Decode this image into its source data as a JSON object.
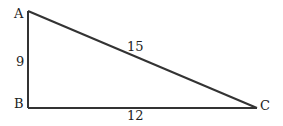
{
  "diagram": {
    "type": "right-triangle",
    "vertices": [
      {
        "id": "A",
        "label": "A",
        "x": 28,
        "y": 11,
        "label_x": 14,
        "label_y": 18
      },
      {
        "id": "B",
        "label": "B",
        "x": 28,
        "y": 108,
        "label_x": 14,
        "label_y": 108
      },
      {
        "id": "C",
        "label": "C",
        "x": 257,
        "y": 108,
        "label_x": 260,
        "label_y": 110
      }
    ],
    "sides": [
      {
        "id": "AB",
        "label": "9",
        "label_x": 16,
        "label_y": 66
      },
      {
        "id": "AC",
        "label": "15",
        "label_x": 127,
        "label_y": 51
      },
      {
        "id": "BC",
        "label": "12",
        "label_x": 127,
        "label_y": 120
      }
    ],
    "stroke_color": "#333333",
    "text_color": "#222222"
  }
}
